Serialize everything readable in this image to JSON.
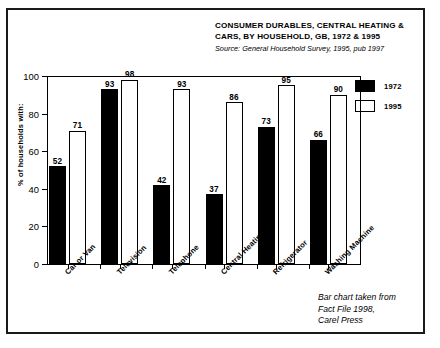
{
  "figure": {
    "title": "CONSUMER DURABLES, CENTRAL HEATING & CARS, BY HOUSEHOLD, GB, 1972 & 1995",
    "source": "Source: General Household Survey, 1995, pub 1997",
    "credit": "Bar chart taken from\nFact File 1998,\nCarel Press"
  },
  "legend": {
    "items": [
      {
        "label": "1972",
        "swatch": "black"
      },
      {
        "label": "1995",
        "swatch": "white"
      }
    ]
  },
  "axes": {
    "y_title": "% of households with:",
    "y_ticks": [
      "0",
      "20",
      "40",
      "60",
      "80",
      "100"
    ]
  },
  "chart_data": {
    "type": "bar",
    "title": "CONSUMER DURABLES, CENTRAL HEATING & CARS, BY HOUSEHOLD, GB, 1972 & 1995",
    "subtitle": "Source: General Household Survey, 1995, pub 1997",
    "xlabel": "",
    "ylabel": "% of households with:",
    "ylim": [
      0,
      100
    ],
    "yticks": [
      0,
      20,
      40,
      60,
      80,
      100
    ],
    "grid": false,
    "legend_position": "top-right",
    "categories": [
      "Car or Van",
      "Television",
      "Telephone",
      "Central Heating",
      "Refrigerator",
      "Washing Machine"
    ],
    "series": [
      {
        "name": "1972",
        "color": "#000000",
        "values": [
          52,
          93,
          42,
          37,
          73,
          66
        ]
      },
      {
        "name": "1995",
        "color": "#ffffff",
        "values": [
          71,
          98,
          93,
          86,
          95,
          90
        ]
      }
    ]
  }
}
